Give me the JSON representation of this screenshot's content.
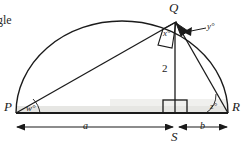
{
  "figure": {
    "type": "geometry-diagram",
    "cut_off_text": "gle",
    "vertices": [
      {
        "name": "P",
        "label": "P",
        "x": 16,
        "y": 113
      },
      {
        "name": "Q",
        "label": "Q",
        "x": 175,
        "y": 21
      },
      {
        "name": "R",
        "label": "R",
        "x": 228,
        "y": 113
      },
      {
        "name": "S",
        "label": "S",
        "x": 175,
        "y": 113
      }
    ],
    "angles": [
      {
        "name": "w",
        "label": "w°",
        "at": "P"
      },
      {
        "name": "x",
        "label": "x°",
        "at": "Q"
      },
      {
        "name": "y",
        "label": "y°",
        "at": "Q"
      },
      {
        "name": "z",
        "label": "z°",
        "at": "R"
      }
    ],
    "segments": [
      {
        "name": "altitude",
        "label": "2",
        "from": "Q",
        "to": "S"
      },
      {
        "name": "base-left",
        "label": "a",
        "from": "P",
        "to": "S"
      },
      {
        "name": "base-right",
        "label": "b",
        "from": "S",
        "to": "R"
      }
    ],
    "right_angle_markers": [
      {
        "name": "right-angle-at-Q",
        "at": "Q"
      },
      {
        "name": "right-angle-at-S",
        "at": "S"
      }
    ],
    "colors": {
      "stroke": "#1b1b1b",
      "background": "#ffffff",
      "baseline_shadow": "#d8d8d4"
    }
  },
  "labels": {
    "vertex_P": "P",
    "vertex_Q": "Q",
    "vertex_R": "R",
    "vertex_S": "S",
    "angle_w": "w°",
    "angle_x": "x°",
    "angle_y": "y°",
    "angle_z": "z°",
    "length_two": "2",
    "dim_a": "a",
    "dim_b": "b",
    "cut_text": "gle"
  }
}
